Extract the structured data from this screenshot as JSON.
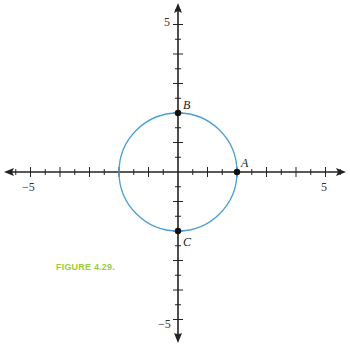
{
  "caption": {
    "text": "FIGURE 4.29.",
    "color": "#9ccb3b"
  },
  "chart_data": {
    "type": "scatter",
    "title": "",
    "xlabel": "",
    "ylabel": "",
    "xlim": [
      -5.8,
      5.8
    ],
    "ylim": [
      -5.8,
      5.8
    ],
    "grid": false,
    "x_tick_labels": [
      "-5",
      "5"
    ],
    "y_tick_labels": [
      "5",
      "-5"
    ],
    "curves": [
      {
        "name": "circle",
        "shape": "circle",
        "center": [
          0,
          0
        ],
        "radius": 2,
        "color": "#4a9fd4"
      }
    ],
    "points": [
      {
        "label": "A",
        "x": 2,
        "y": 0
      },
      {
        "label": "B",
        "x": 0,
        "y": 2
      },
      {
        "label": "C",
        "x": 0,
        "y": -2
      }
    ]
  },
  "labels": {
    "x_neg5": "−5",
    "x_pos5": "5",
    "y_pos5": "5",
    "y_neg5": "−5",
    "A": "A",
    "B": "B",
    "C": "C"
  }
}
